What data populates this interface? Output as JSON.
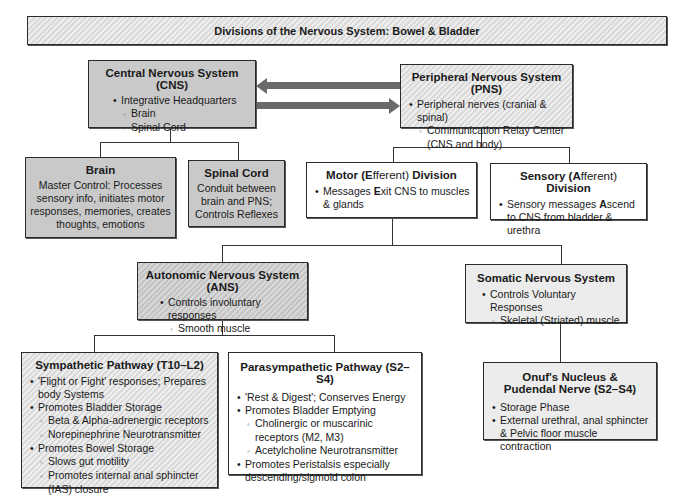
{
  "title": "Divisions of the Nervous System: Bowel & Bladder",
  "cns": {
    "heading": "Central Nervous System (CNS)",
    "items": [
      "Integrative Headquarters"
    ],
    "subitems": [
      "Brain",
      "Spinal Cord"
    ]
  },
  "pns": {
    "heading": "Peripheral Nervous System (PNS)",
    "items": [
      "Peripheral nerves (cranial & spinal)"
    ],
    "subitems": [
      "Communication Relay Center (CNS and body)"
    ]
  },
  "brain": {
    "heading": "Brain",
    "text": "Master Control: Processes sensory info, initiates motor responses, memories, creates thoughts, emotions"
  },
  "spinal_cord": {
    "heading": "Spinal Cord",
    "text": "Conduit between brain and PNS; Controls Reflexes"
  },
  "motor": {
    "heading_parts": [
      "Motor (",
      "E",
      "fferent) ",
      "Division"
    ],
    "item_parts": [
      "Messages ",
      "E",
      "xit CNS to muscles & glands"
    ]
  },
  "sensory": {
    "heading_parts": [
      "Sensory (",
      "A",
      "fferent) ",
      "Division"
    ],
    "item_parts": [
      "Sensory messages ",
      "A",
      "scend to CNS from bladder & urethra"
    ]
  },
  "ans": {
    "heading": "Autonomic Nervous System (ANS)",
    "items": [
      "Controls involuntary responses"
    ],
    "subitems": [
      "Smooth muscle"
    ]
  },
  "somatic": {
    "heading": "Somatic Nervous System",
    "items": [
      "Controls Voluntary Responses"
    ],
    "subitems": [
      "Skeletal (Striated) muscle"
    ]
  },
  "sympathetic": {
    "heading": "Sympathetic Pathway (T10–L2)",
    "lines": [
      {
        "level": "b",
        "text": "'Flight or Fight' responses; Prepares body Systems"
      },
      {
        "level": "b",
        "text": "Promotes Bladder Storage"
      },
      {
        "level": "s",
        "text": "Beta & Alpha-adrenergic receptors"
      },
      {
        "level": "s",
        "text": "Norepinephrine Neurotransmitter"
      },
      {
        "level": "b",
        "text": "Promotes Bowel Storage"
      },
      {
        "level": "s",
        "text": "Slows gut motility"
      },
      {
        "level": "s",
        "text": "Promotes internal anal sphincter (IAS) closure"
      }
    ]
  },
  "parasympathetic": {
    "heading": "Parasympathetic Pathway (S2–S4)",
    "lines": [
      {
        "level": "b",
        "text": "'Rest & Digest'; Conserves Energy"
      },
      {
        "level": "b",
        "text": "Promotes Bladder Emptying"
      },
      {
        "level": "s",
        "text": "Cholinergic or muscarinic receptors (M2, M3)"
      },
      {
        "level": "s",
        "text": "Acetylcholine Neurotransmitter"
      },
      {
        "level": "b",
        "text": "Promotes Peristalsis especially descending/sigmoid colon"
      }
    ]
  },
  "onuf": {
    "heading_line1": "Onuf's Nucleus &",
    "heading_line2": "Pudendal Nerve (S2–S4)",
    "lines": [
      {
        "level": "b",
        "text": "Storage Phase"
      },
      {
        "level": "b",
        "text": "External urethral, anal sphincter & Pelvic floor muscle contraction"
      }
    ]
  },
  "colors": {
    "gray_fill": "#c9c9c9",
    "light_fill": "#ececec",
    "border": "#2b2b2b",
    "arrow": "#6a6a6a"
  }
}
